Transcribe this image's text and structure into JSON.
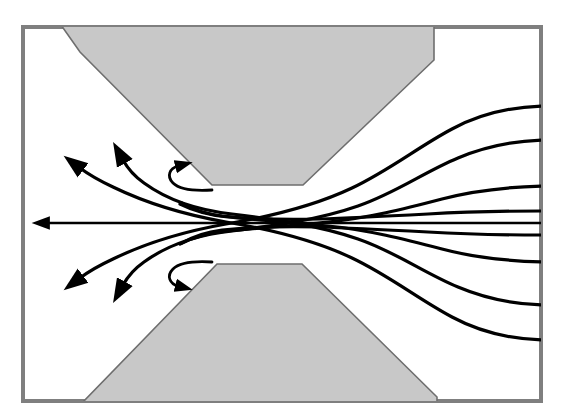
{
  "figure": {
    "canvas": {
      "width": 570,
      "height": 420
    },
    "colors": {
      "background": "#ffffff",
      "frame": "#7f7f7f",
      "body_fill": "#c8c8c8",
      "body_stroke": "#6e6e6e",
      "streamline": "#000000"
    },
    "frame": {
      "x": 21,
      "y": 25,
      "width": 522,
      "height": 378,
      "stroke_width": 4
    },
    "bodies": [
      {
        "name": "upper-pole-piece",
        "points": "61,25 434,25 434,60 303,185 212,185 80,52"
      },
      {
        "name": "lower-pole-piece",
        "points": "82,403 217,264 302,264 437,397 437,403"
      }
    ],
    "axis_line": {
      "name": "axis-streamline",
      "y": 223,
      "x_start": 543,
      "x_end": 43
    },
    "streamlines": [
      {
        "name": "upper-outer-1",
        "path": "M 543,106 C 500,108 470,116 440,133 C 405,153 375,176 330,195 C 285,214 240,222 195,227 C 160,231 120,240 86,261",
        "arrow": {
          "x": 76,
          "y": 286,
          "angle": 118
        }
      },
      {
        "name": "upper-outer-2",
        "path": "M 543,140 C 505,141 472,148 444,161 C 410,177 380,196 338,209 C 300,221 255,227 215,232 C 180,236 148,250 127,272",
        "arrow": {
          "x": 119,
          "y": 299,
          "angle": 110
        }
      },
      {
        "name": "upper-inner-1",
        "path": "M 543,186 C 500,187 465,192 432,202 C 395,213 360,222 320,226 C 285,230 250,232 222,236 C 200,239 185,246 178,255",
        "arrow": null
      },
      {
        "name": "upper-inner-2",
        "path": "M 543,223 C 480,222 420,222 370,222 C 330,222 290,221 250,219",
        "arrow": null
      },
      {
        "name": "lower-inner-1",
        "path": "M 543,262 C 500,261 460,255 430,247 C 395,238 360,230 320,226 C 285,222 250,220 222,216 C 200,213 185,206 178,197",
        "arrow": null
      },
      {
        "name": "lower-outer-1",
        "path": "M 543,305 C 505,304 472,298 444,288 C 410,275 380,256 338,243 C 300,231 255,225 215,220 C 180,216 148,202 127,180",
        "arrow": {
          "x": 119,
          "y": 153,
          "angle": -110
        }
      },
      {
        "name": "lower-outer-2",
        "path": "M 543,340 C 500,339 470,332 440,319 C 405,299 375,276 330,257 C 285,238 240,230 195,225 C 160,221 120,212 86,191",
        "arrow": {
          "x": 76,
          "y": 166,
          "angle": -118
        }
      }
    ],
    "curl_arrows": [
      {
        "name": "upper-recirculation-curl",
        "path": "M 207,189 C 190,190 175,187 172,179 C 169,171 175,166 182,167",
        "tip": {
          "x": 186,
          "y": 168
        },
        "angle": -50
      },
      {
        "name": "lower-recirculation-curl",
        "path": "M 207,263 C 190,262 175,265 172,273 C 169,281 175,286 182,285",
        "tip": {
          "x": 186,
          "y": 284
        },
        "angle": 50
      }
    ],
    "arrow_count": 5,
    "streamline_count": 8
  }
}
